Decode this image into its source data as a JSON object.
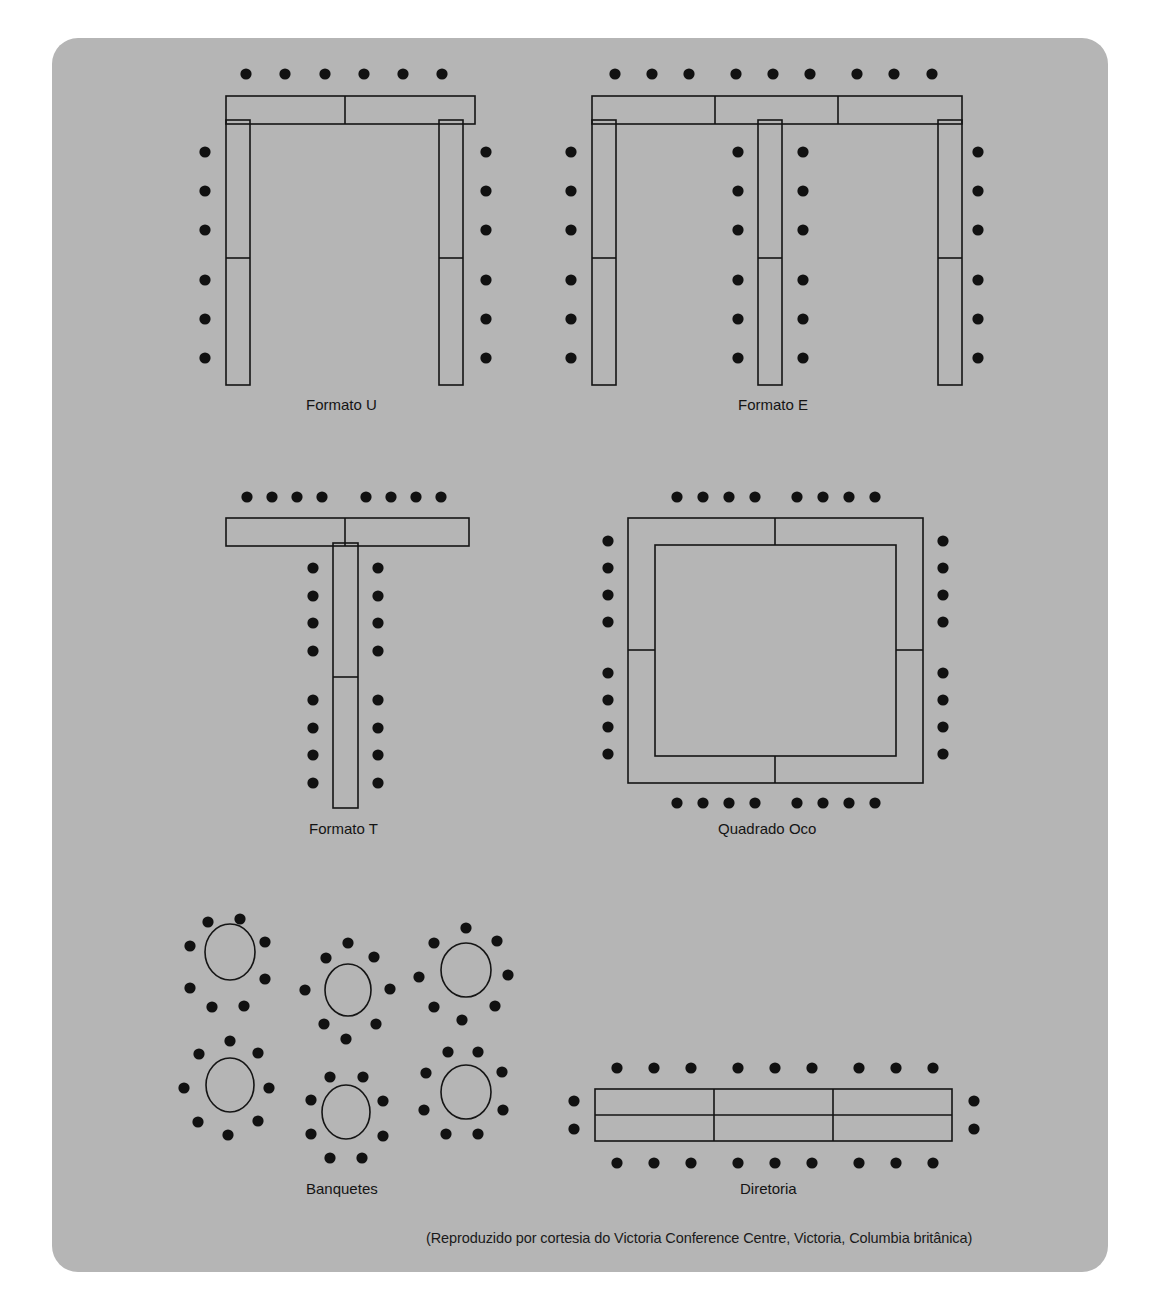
{
  "document": {
    "type": "room-setup-diagram",
    "caption": "(Reproduzido por cortesia do Victoria Conference Centre, Victoria, Columbia britânica)",
    "panel_color": "#b5b5b5",
    "page_color": "#ffffff",
    "ink_color": "#111111"
  },
  "layouts": [
    {
      "id": "formato-u",
      "label": "Formato U",
      "shape": "U",
      "seats_top": 6,
      "seats_left_outer": 6,
      "seats_right_outer": 6,
      "total_seats": 18,
      "tables_top": 2,
      "tables_per_leg": 2
    },
    {
      "id": "formato-e",
      "label": "Formato E",
      "shape": "E",
      "seats_top": 8,
      "seats_left_outer": 6,
      "seats_right_outer": 6,
      "seats_middle_left": 6,
      "seats_middle_right": 6,
      "total_seats": 32,
      "tables_top": 3,
      "legs": 3,
      "tables_per_leg": 2
    },
    {
      "id": "formato-t",
      "label": "Formato T",
      "shape": "T",
      "seats_top": 8,
      "seats_stem_left": 8,
      "seats_stem_right": 8,
      "total_seats": 24,
      "tables_top": 2,
      "tables_stem": 2
    },
    {
      "id": "quadrado-oco",
      "label": "Quadrado Oco",
      "shape": "hollow-square",
      "seats_top": 8,
      "seats_bottom": 8,
      "seats_left": 8,
      "seats_right": 8,
      "total_seats": 32,
      "tables_per_side": 2
    },
    {
      "id": "banquetes",
      "label": "Banquetes",
      "shape": "round-tables",
      "tables": 6,
      "seats_per_table": 8,
      "total_seats": 48
    },
    {
      "id": "diretoria",
      "label": "Diretoria",
      "shape": "boardroom",
      "seats_top": 9,
      "seats_bottom": 9,
      "seats_left_end": 2,
      "seats_right_end": 2,
      "total_seats": 22,
      "tables": 6
    }
  ]
}
